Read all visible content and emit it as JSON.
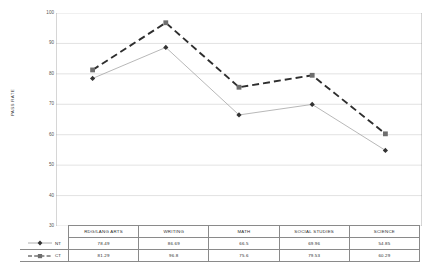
{
  "chart_data": {
    "type": "line",
    "title": "",
    "xlabel": "",
    "ylabel": "PASS RATE",
    "ylim": [
      30,
      100
    ],
    "yticks": [
      100,
      90,
      80,
      70,
      60,
      50,
      40,
      30
    ],
    "grid": true,
    "legend_position": "table-left",
    "categories": [
      "RDG/LANG ARTS",
      "WRITING",
      "MATH",
      "SOCIAL STUDIES",
      "SCIENCE"
    ],
    "series": [
      {
        "name": "NT",
        "marker": "diamond",
        "line_style": "solid",
        "color": "#9a9a9a",
        "marker_color": "#333333",
        "values": [
          78.49,
          88.69,
          66.5,
          69.96,
          54.85
        ],
        "labels": [
          "78.49",
          "86.69",
          "66.5",
          "69.96",
          "54.85"
        ]
      },
      {
        "name": "CT",
        "marker": "square",
        "line_style": "dashed",
        "color": "#2e2e2e",
        "marker_color": "#6e6e6e",
        "values": [
          81.29,
          96.8,
          75.6,
          79.53,
          60.29
        ],
        "labels": [
          "81.29",
          "96.8",
          "75.6",
          "79.53",
          "60.29"
        ]
      }
    ]
  },
  "axis": {
    "y_title": "PASS RATE",
    "tick_labels": [
      "100",
      "90",
      "80",
      "70",
      "60",
      "50",
      "40",
      "30"
    ]
  },
  "table": {
    "category_headers": [
      "RDG/LANG ARTS",
      "WRITING",
      "MATH",
      "SOCIAL STUDIES",
      "SCIENCE"
    ],
    "rows": [
      {
        "series_label": "NT",
        "values": [
          "78.49",
          "86.69",
          "66.5",
          "69.96",
          "54.85"
        ]
      },
      {
        "series_label": "CT",
        "values": [
          "81.29",
          "96.8",
          "75.6",
          "79.53",
          "60.29"
        ]
      }
    ]
  },
  "colors": {
    "grid": "#cfcfcf",
    "axis": "#8a8a8a",
    "nt_line": "#9a9a9a",
    "ct_line": "#2e2e2e",
    "table_border": "#8a8a8a"
  }
}
